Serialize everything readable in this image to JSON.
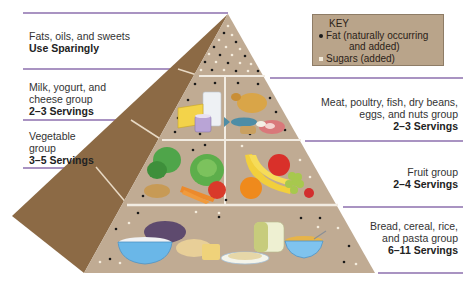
{
  "key": {
    "title": "KEY",
    "items": [
      {
        "label": "Fat (naturally occurring",
        "label_cont": "and added)",
        "symbol": "black-dot",
        "color": "#1a1a1a"
      },
      {
        "label": "Sugars (added)",
        "symbol": "white-dot",
        "color": "#f4ecdc"
      }
    ]
  },
  "tiers": [
    {
      "id": "fats",
      "name": "Fats, oils, and sweets",
      "servings": "Use Sparingly",
      "side": "left"
    },
    {
      "id": "milk",
      "name_lines": [
        "Milk, yogurt, and",
        "cheese group"
      ],
      "servings": "2–3 Servings",
      "side": "left"
    },
    {
      "id": "meat",
      "name_lines": [
        "Meat, poultry, fish, dry beans,",
        "eggs, and nuts group"
      ],
      "servings": "2–3 Servings",
      "side": "right"
    },
    {
      "id": "vegetable",
      "name_lines": [
        "Vegetable",
        "group"
      ],
      "servings": "3–5 Servings",
      "side": "left"
    },
    {
      "id": "fruit",
      "name_lines": [
        "Fruit group"
      ],
      "servings": "2–4 Servings",
      "side": "right"
    },
    {
      "id": "bread",
      "name_lines": [
        "Bread, cereal, rice,",
        "and pasta group"
      ],
      "servings": "6–11 Servings",
      "side": "right"
    }
  ],
  "colors": {
    "pyramid_front": "#c0ab93",
    "pyramid_side": "#8c6a45",
    "divider": "#f2ece2",
    "rule": "#a993c2",
    "key_bg": "#b9a48a"
  }
}
